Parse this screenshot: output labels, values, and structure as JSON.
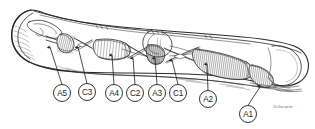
{
  "figure": {
    "type": "anatomical-line-drawing",
    "background_color": "#ffffff",
    "ink_color": "#2a2a2a",
    "width": 315,
    "height": 129,
    "signature": "Schwartz"
  },
  "callouts": [
    {
      "id": "a5",
      "label": "A5",
      "cx": 62,
      "cy": 93,
      "r": 8.5,
      "arrow_x": 50,
      "arrow_y": 47,
      "name": "callout-a5"
    },
    {
      "id": "c3",
      "label": "C3",
      "cx": 87,
      "cy": 92,
      "r": 8.5,
      "arrow_x": 78,
      "arrow_y": 47,
      "name": "callout-c3"
    },
    {
      "id": "a4",
      "label": "A4",
      "cx": 114,
      "cy": 93,
      "r": 8.5,
      "arrow_x": 112,
      "arrow_y": 55,
      "name": "callout-a4"
    },
    {
      "id": "c2",
      "label": "C2",
      "cx": 135,
      "cy": 93,
      "r": 8.5,
      "arrow_x": 133,
      "arrow_y": 58,
      "name": "callout-c2"
    },
    {
      "id": "a3",
      "label": "A3",
      "cx": 157,
      "cy": 93,
      "r": 8.5,
      "arrow_x": 155,
      "arrow_y": 58,
      "name": "callout-a3"
    },
    {
      "id": "c1",
      "label": "C1",
      "cx": 178,
      "cy": 93,
      "r": 8.5,
      "arrow_x": 172,
      "arrow_y": 60,
      "name": "callout-c1"
    },
    {
      "id": "a2",
      "label": "A2",
      "cx": 208,
      "cy": 99,
      "r": 8.5,
      "arrow_x": 207,
      "arrow_y": 64,
      "name": "callout-a2"
    },
    {
      "id": "a1",
      "label": "A1",
      "cx": 248,
      "cy": 114,
      "r": 8.5,
      "arrow_x": 260,
      "arrow_y": 87,
      "name": "callout-a1"
    }
  ],
  "structures": [
    {
      "name": "distal-phalanx-tip",
      "label": "fingertip pulp"
    },
    {
      "name": "a5-pulley",
      "label": "A5 annular pulley"
    },
    {
      "name": "c3-pulley",
      "label": "C3 cruciate pulley"
    },
    {
      "name": "a4-pulley",
      "label": "A4 annular pulley"
    },
    {
      "name": "c2-pulley",
      "label": "C2 cruciate pulley"
    },
    {
      "name": "a3-pulley",
      "label": "A3 annular pulley"
    },
    {
      "name": "c1-pulley",
      "label": "C1 cruciate pulley"
    },
    {
      "name": "a2-pulley",
      "label": "A2 annular pulley"
    },
    {
      "name": "a1-pulley",
      "label": "A1 annular pulley"
    },
    {
      "name": "flexor-tendon-sheath",
      "label": "flexor tendon sheath"
    },
    {
      "name": "metacarpal-head",
      "label": "metacarpal head"
    }
  ]
}
